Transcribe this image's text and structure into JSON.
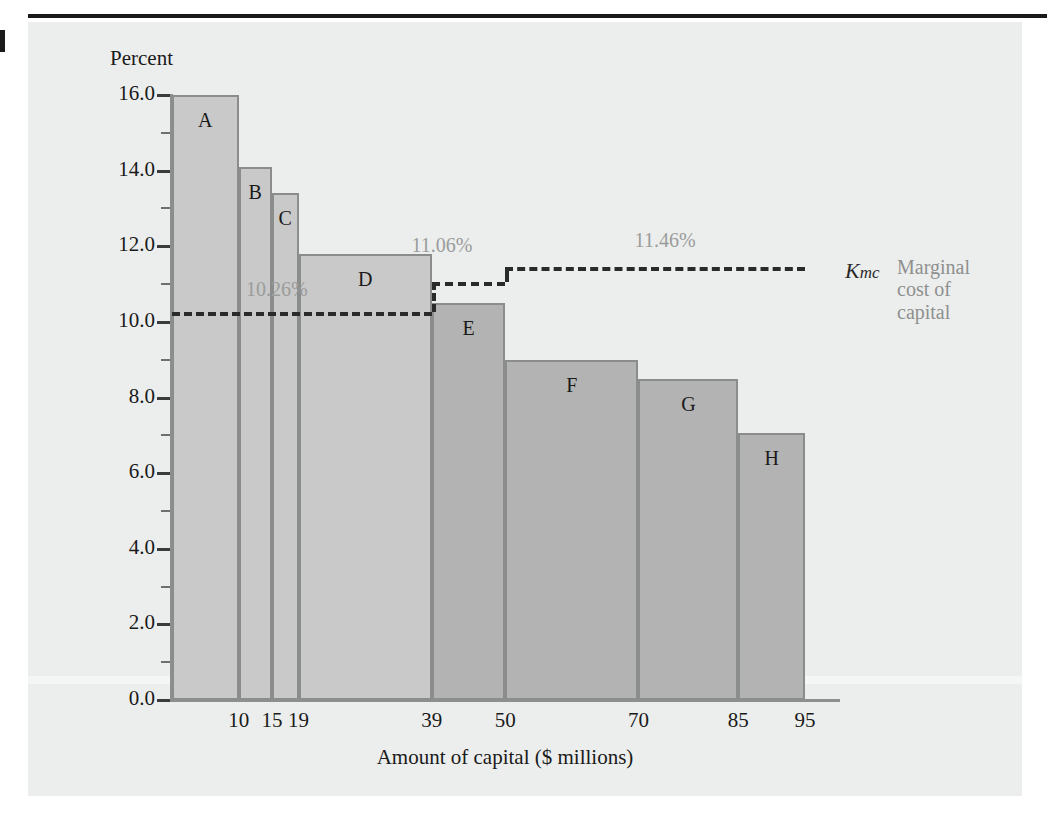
{
  "figure": {
    "background_color": "#eceeed",
    "rule_color": "#1a1a1a"
  },
  "chart_data": {
    "type": "bar",
    "title": "",
    "subtitle": "",
    "ylabel": "Percent",
    "xlabel": "Amount of capital ($ millions)",
    "ylim": [
      0.0,
      16.0
    ],
    "xlim": [
      0,
      100
    ],
    "grid": false,
    "legend": "none",
    "ytick_labels": [
      "0.0",
      "2.0",
      "4.0",
      "6.0",
      "8.0",
      "10.0",
      "12.0",
      "14.0",
      "16.0"
    ],
    "ytick_values": [
      0.0,
      2.0,
      4.0,
      6.0,
      8.0,
      10.0,
      12.0,
      14.0,
      16.0
    ],
    "yminor_values": [
      1.0,
      3.0,
      5.0,
      7.0,
      9.0,
      11.0,
      13.0,
      15.0
    ],
    "xtick_labels": [
      "10",
      "15",
      "19",
      "39",
      "50",
      "70",
      "85",
      "95"
    ],
    "xtick_values": [
      10,
      15,
      19,
      39,
      50,
      70,
      85,
      95
    ],
    "bars": [
      {
        "label": "A",
        "x_start": 0,
        "x_end": 10,
        "value": 16.0,
        "shade": "light"
      },
      {
        "label": "B",
        "x_start": 10,
        "x_end": 15,
        "value": 14.1,
        "shade": "light"
      },
      {
        "label": "C",
        "x_start": 15,
        "x_end": 19,
        "value": 13.4,
        "shade": "light"
      },
      {
        "label": "D",
        "x_start": 19,
        "x_end": 39,
        "value": 11.8,
        "shade": "light"
      },
      {
        "label": "E",
        "x_start": 39,
        "x_end": 50,
        "value": 10.5,
        "shade": "dark"
      },
      {
        "label": "F",
        "x_start": 50,
        "x_end": 70,
        "value": 9.0,
        "shade": "dark"
      },
      {
        "label": "G",
        "x_start": 70,
        "x_end": 85,
        "value": 8.5,
        "shade": "dark"
      },
      {
        "label": "H",
        "x_start": 85,
        "x_end": 95,
        "value": 7.05,
        "shade": "dark"
      }
    ],
    "step_line": {
      "name": "Marginal cost of capital",
      "symbol": "K",
      "symbol_subscript": "mc",
      "segments": [
        {
          "label": "10.26%",
          "value": 10.26,
          "x_start": 0,
          "x_end": 39
        },
        {
          "label": "11.06%",
          "value": 11.06,
          "x_start": 39,
          "x_end": 50
        },
        {
          "label": "11.46%",
          "value": 11.46,
          "x_start": 50,
          "x_end": 95
        }
      ],
      "annotation_lines": [
        "Marginal",
        "cost of",
        "capital"
      ]
    }
  }
}
